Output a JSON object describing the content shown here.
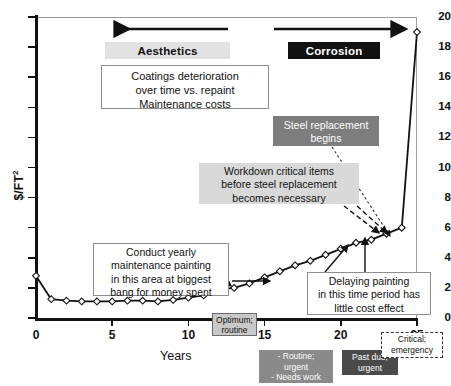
{
  "chart_data": {
    "type": "line",
    "title": "",
    "xlabel": "Years",
    "ylabel": "$/FT2",
    "xlim": [
      0,
      25
    ],
    "ylim": [
      0,
      20
    ],
    "grid": false,
    "legend_position": "below-axis",
    "xticks": [
      0,
      5,
      10,
      15,
      20,
      25
    ],
    "yticks": [
      0,
      2,
      4,
      6,
      8,
      10,
      12,
      14,
      16,
      18,
      20
    ],
    "marker": "diamond-open",
    "series": [
      {
        "name": "Coating cost over time",
        "x": [
          0,
          1,
          2,
          3,
          4,
          5,
          6,
          7,
          8,
          9,
          10,
          11,
          12,
          13,
          14,
          15,
          16,
          17,
          18,
          19,
          20,
          21,
          22,
          23,
          24,
          25
        ],
        "values": [
          2.8,
          1.25,
          1.15,
          1.1,
          1.1,
          1.1,
          1.15,
          1.15,
          1.1,
          1.2,
          1.35,
          1.5,
          1.9,
          2.0,
          2.3,
          2.7,
          3.1,
          3.5,
          3.8,
          4.2,
          4.6,
          5.0,
          5.2,
          5.6,
          6.0,
          19.0
        ]
      }
    ]
  },
  "axes": {
    "y_label": "$/FT",
    "y_label_sup": "2",
    "x_label": "Years",
    "y_tick_labels": [
      "20",
      "18",
      "16",
      "14",
      "12",
      "10",
      "8",
      "6",
      "4",
      "2",
      "0"
    ],
    "x_tick_labels": [
      "0",
      "5",
      "10",
      "15",
      "20",
      "25"
    ]
  },
  "banners": {
    "aesthetics": {
      "label": "Aesthetics",
      "bg": "#e2e2e2",
      "fg": "#111111",
      "arrow_direction": "left"
    },
    "corrosion": {
      "label": "Corrosion",
      "bg": "#111111",
      "fg": "#ffffff",
      "arrow_direction": "right"
    }
  },
  "callouts": {
    "coatings": {
      "line1": "Coatings deterioration",
      "line2": "over time vs. repaint",
      "line3": "Maintenance costs"
    },
    "steel_replacement": {
      "line1": "Steel replacement",
      "line2": "begins"
    },
    "workdown": {
      "line1": "Workdown critical items",
      "line2": "before steel replacement",
      "line3": "becomes necessary"
    },
    "conduct": {
      "line1": "Conduct yearly",
      "line2": "maintenance painting",
      "line3": "in this area at biggest",
      "line4": "bang for money spent"
    },
    "delaying": {
      "line1": "Delaying painting",
      "line2": "in this time period has",
      "line3": "little cost effect"
    }
  },
  "status_tags": {
    "optimum": {
      "line1": "Optimum;",
      "line2": "routine",
      "bg": "#c9c9c9",
      "fg": "#111111"
    },
    "routine_urgent": {
      "line1": "- Routine;",
      "line2": "urgent",
      "line3": "- Needs work",
      "bg": "#8a8a8a",
      "fg": "#ffffff"
    },
    "past_due": {
      "line1": "Past due;",
      "line2": "urgent",
      "bg": "#4a4a4a",
      "fg": "#ffffff"
    },
    "critical": {
      "line1": "Critical;",
      "line2": "emergency",
      "bg": "#ffffff",
      "fg": "#111111",
      "border": "dashed"
    }
  }
}
